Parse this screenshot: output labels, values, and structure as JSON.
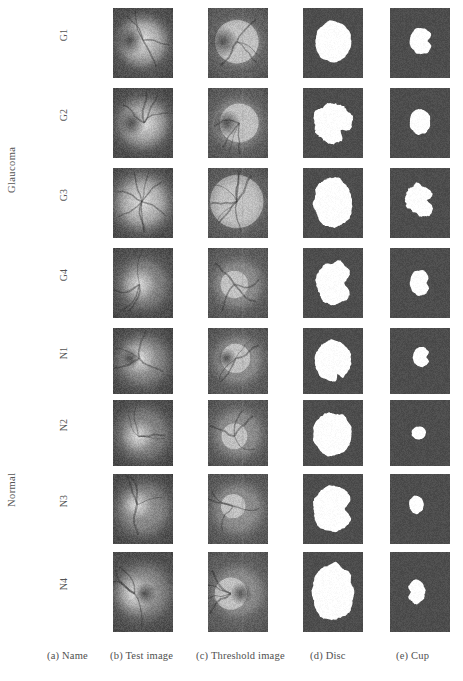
{
  "figure": {
    "kind": "image-grid",
    "background": "#ffffff",
    "group_labels": [
      {
        "id": "glaucoma",
        "text": "Glaucoma",
        "rows": [
          "G1",
          "G2",
          "G3",
          "G4"
        ]
      },
      {
        "id": "normal",
        "text": "Normal",
        "rows": [
          "N1",
          "N2",
          "N3",
          "N4"
        ]
      }
    ],
    "columns": [
      {
        "key": "name",
        "caption": "(a) Name"
      },
      {
        "key": "test",
        "caption": "(b) Test image"
      },
      {
        "key": "threshold",
        "caption": "(c) Threshold image"
      },
      {
        "key": "disc",
        "caption": "(d) Disc"
      },
      {
        "key": "cup",
        "caption": "(e) Cup"
      }
    ],
    "colors": {
      "mask_background": "#4d4d4d",
      "mask_foreground": "#ffffff",
      "fundus_base": "#6b6b6b",
      "fundus_disc": "#d8d8d8",
      "threshold_base": "#7a7a7a",
      "threshold_disc": "#c9c9c9",
      "text": "#4f4f4f"
    },
    "geometry": {
      "cell_width": 60,
      "cell_height": 70,
      "col_x": [
        113,
        208,
        303,
        390
      ],
      "row_y": [
        8,
        88,
        168,
        248,
        328,
        400,
        474,
        552
      ],
      "row_heights": [
        70,
        70,
        70,
        70,
        66,
        66,
        70,
        80
      ]
    },
    "rows": [
      {
        "name": "G1",
        "fundus": {
          "cx": 0.5,
          "cy": 0.5,
          "r": 0.4,
          "disc_cx": 0.5,
          "disc_cy": 0.46,
          "disc_r": 0.26,
          "brightness": 0.95,
          "notch": "left"
        },
        "threshold": {
          "cx": 0.5,
          "cy": 0.5,
          "r": 0.38,
          "disc_cx": 0.48,
          "disc_cy": 0.48,
          "disc_r": 0.27,
          "notch": "left"
        },
        "disc": {
          "cx": 0.5,
          "cy": 0.48,
          "rx": 0.3,
          "ry": 0.3,
          "rough": 0.05,
          "notch": null
        },
        "cup": {
          "cx": 0.52,
          "cy": 0.47,
          "rx": 0.19,
          "ry": 0.19,
          "rough": 0.05,
          "notch": "left"
        }
      },
      {
        "name": "G2",
        "fundus": {
          "cx": 0.5,
          "cy": 0.5,
          "r": 0.44,
          "disc_cx": 0.52,
          "disc_cy": 0.5,
          "disc_r": 0.24,
          "brightness": 0.88,
          "notch": "left"
        },
        "threshold": {
          "cx": 0.5,
          "cy": 0.5,
          "r": 0.4,
          "disc_cx": 0.52,
          "disc_cy": 0.5,
          "disc_r": 0.24,
          "notch": "left"
        },
        "disc": {
          "cx": 0.49,
          "cy": 0.5,
          "rx": 0.32,
          "ry": 0.3,
          "rough": 0.1,
          "notch": "topleft"
        },
        "cup": {
          "cx": 0.5,
          "cy": 0.48,
          "rx": 0.17,
          "ry": 0.18,
          "rough": 0.07,
          "notch": null
        }
      },
      {
        "name": "G3",
        "fundus": {
          "cx": 0.5,
          "cy": 0.5,
          "r": 0.42,
          "disc_cx": 0.48,
          "disc_cy": 0.48,
          "disc_r": 0.33,
          "brightness": 0.8,
          "notch": "vessels"
        },
        "threshold": {
          "cx": 0.5,
          "cy": 0.5,
          "r": 0.4,
          "disc_cx": 0.48,
          "disc_cy": 0.48,
          "disc_r": 0.33,
          "notch": "vessels"
        },
        "disc": {
          "cx": 0.5,
          "cy": 0.5,
          "rx": 0.32,
          "ry": 0.36,
          "rough": 0.08,
          "notch": null
        },
        "cup": {
          "cx": 0.5,
          "cy": 0.46,
          "rx": 0.24,
          "ry": 0.22,
          "rough": 0.14,
          "notch": "left"
        }
      },
      {
        "name": "G4",
        "fundus": {
          "cx": 0.5,
          "cy": 0.52,
          "r": 0.42,
          "disc_cx": 0.44,
          "disc_cy": 0.52,
          "disc_r": 0.17,
          "brightness": 0.72,
          "notch": null
        },
        "threshold": {
          "cx": 0.5,
          "cy": 0.52,
          "r": 0.4,
          "disc_cx": 0.44,
          "disc_cy": 0.52,
          "disc_r": 0.17,
          "notch": null
        },
        "disc": {
          "cx": 0.52,
          "cy": 0.5,
          "rx": 0.3,
          "ry": 0.31,
          "rough": 0.09,
          "notch": "left"
        },
        "cup": {
          "cx": 0.5,
          "cy": 0.5,
          "rx": 0.17,
          "ry": 0.18,
          "rough": 0.06,
          "notch": "left"
        }
      },
      {
        "name": "N1",
        "fundus": {
          "cx": 0.5,
          "cy": 0.48,
          "r": 0.44,
          "disc_cx": 0.44,
          "disc_cy": 0.46,
          "disc_r": 0.18,
          "brightness": 0.85,
          "notch": "left"
        },
        "threshold": {
          "cx": 0.5,
          "cy": 0.48,
          "r": 0.4,
          "disc_cx": 0.46,
          "disc_cy": 0.46,
          "disc_r": 0.18,
          "notch": "left"
        },
        "disc": {
          "cx": 0.5,
          "cy": 0.5,
          "rx": 0.3,
          "ry": 0.31,
          "rough": 0.06,
          "notch": "topcleft"
        },
        "cup": {
          "cx": 0.52,
          "cy": 0.44,
          "rx": 0.14,
          "ry": 0.15,
          "rough": 0.06,
          "notch": "left"
        }
      },
      {
        "name": "N2",
        "fundus": {
          "cx": 0.5,
          "cy": 0.52,
          "r": 0.44,
          "disc_cx": 0.42,
          "disc_cy": 0.55,
          "disc_r": 0.16,
          "brightness": 0.7,
          "notch": null
        },
        "threshold": {
          "cx": 0.5,
          "cy": 0.52,
          "r": 0.4,
          "disc_cx": 0.44,
          "disc_cy": 0.55,
          "disc_r": 0.16,
          "notch": null
        },
        "disc": {
          "cx": 0.49,
          "cy": 0.52,
          "rx": 0.32,
          "ry": 0.33,
          "rough": 0.07,
          "notch": null
        },
        "cup": {
          "cx": 0.48,
          "cy": 0.5,
          "rx": 0.12,
          "ry": 0.1,
          "rough": 0.06,
          "notch": null
        }
      },
      {
        "name": "N3",
        "fundus": {
          "cx": 0.5,
          "cy": 0.5,
          "r": 0.45,
          "disc_cx": 0.4,
          "disc_cy": 0.44,
          "disc_r": 0.15,
          "brightness": 0.88,
          "notch": null
        },
        "threshold": {
          "cx": 0.5,
          "cy": 0.5,
          "r": 0.42,
          "disc_cx": 0.42,
          "disc_cy": 0.46,
          "disc_r": 0.15,
          "notch": null
        },
        "disc": {
          "cx": 0.5,
          "cy": 0.5,
          "rx": 0.33,
          "ry": 0.33,
          "rough": 0.07,
          "notch": "left"
        },
        "cup": {
          "cx": 0.44,
          "cy": 0.44,
          "rx": 0.12,
          "ry": 0.13,
          "rough": 0.07,
          "notch": null
        }
      },
      {
        "name": "N4",
        "fundus": {
          "cx": 0.5,
          "cy": 0.5,
          "r": 0.46,
          "disc_cx": 0.36,
          "disc_cy": 0.52,
          "disc_r": 0.2,
          "brightness": 0.95,
          "notch": "right"
        },
        "threshold": {
          "cx": 0.5,
          "cy": 0.5,
          "r": 0.42,
          "disc_cx": 0.38,
          "disc_cy": 0.52,
          "disc_r": 0.2,
          "notch": "right"
        },
        "disc": {
          "cx": 0.5,
          "cy": 0.5,
          "rx": 0.34,
          "ry": 0.36,
          "rough": 0.08,
          "notch": null
        },
        "cup": {
          "cx": 0.44,
          "cy": 0.5,
          "rx": 0.15,
          "ry": 0.15,
          "rough": 0.08,
          "notch": "right"
        }
      }
    ]
  }
}
